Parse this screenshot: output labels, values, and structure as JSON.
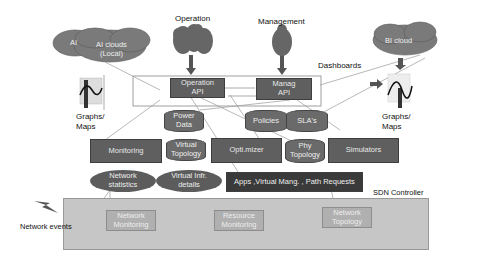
{
  "top_labels": {
    "operation": "Operation",
    "management": "Management",
    "dashboards": "Dashboards"
  },
  "clouds": {
    "ai": "AI",
    "ai_local_line1": "AI clouds",
    "ai_local_line2": "(Local)",
    "bi": "BI cloud"
  },
  "graphs_left": {
    "line1": "Graphs/",
    "line2": "Maps"
  },
  "graphs_right": {
    "line1": "Graphs/",
    "line2": "Maps"
  },
  "apis": {
    "operation_line1": "Operation",
    "operation_line2": "API",
    "management_line1": "Manag",
    "management_line2": "API"
  },
  "databases": {
    "power_line1": "Power",
    "power_line2": "Data",
    "policies": "Policies",
    "slas": "SLA's",
    "virtual_topology_line1": "Virtual",
    "virtual_topology_line2": "Topology",
    "phy_topology_line1": "Phy",
    "phy_topology_line2": "Topology"
  },
  "modules": {
    "monitoring": "Monitoring",
    "optimizer": "Opti.mizer",
    "simulators": "Simulators"
  },
  "ellipses": {
    "network_statistics_line1": "Network",
    "network_statistics_line2": "statistics",
    "virtual_infr_line1": "Virtual Infr.",
    "virtual_infr_line2": "details"
  },
  "requests_bar": "Apps ,Virtual Mang. , Path  Requests",
  "sdn": {
    "title": "SDN Controller",
    "network_monitoring_line1": "Network",
    "network_monitoring_line2": "Monitoring",
    "resource_monitoring_line1": "Resource",
    "resource_monitoring_line2": "Monitoring",
    "network_topology_line1": "Network",
    "network_topology_line2": "Topology"
  },
  "network_events": "Network events",
  "colors": {
    "module_fill": "#5f5f5f",
    "dark_fill": "#3a3a3a",
    "sdn_fill": "#c6c6c6",
    "cloud_fill": "#7a7a7a"
  }
}
